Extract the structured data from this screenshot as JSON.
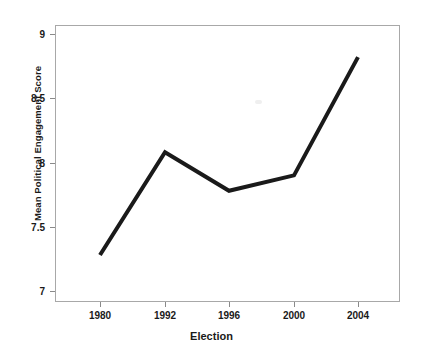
{
  "chart_data": {
    "type": "line",
    "title": "",
    "xlabel": "Election",
    "ylabel": "Mean Political Engagement Score",
    "categories": [
      "1980",
      "1992",
      "1996",
      "2000",
      "2004"
    ],
    "values": [
      7.28,
      8.08,
      7.78,
      7.9,
      8.82
    ],
    "series": [
      {
        "name": "Mean Political Engagement Score",
        "values": [
          7.28,
          8.08,
          7.78,
          7.9,
          8.82
        ]
      }
    ],
    "ylim": [
      7,
      9
    ],
    "ytick_labels": [
      "7",
      "7.5",
      "8",
      "8.5",
      "9"
    ],
    "ytick_values": [
      7,
      7.5,
      8,
      8.5,
      9
    ],
    "xtick_labels": [
      "1980",
      "1992",
      "1996",
      "2000",
      "2004"
    ],
    "grid": false,
    "legend": false,
    "legend_position": "none",
    "line_color": "#1a1a1a",
    "line_width": 4,
    "markers": false,
    "frame_color": "#a8a8a8",
    "background_color": "#ffffff"
  }
}
